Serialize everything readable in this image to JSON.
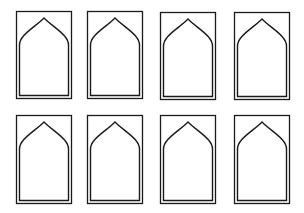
{
  "diagram": {
    "title": "",
    "stroke_color": "#1a1a1a",
    "background_color": "#ffffff",
    "rows": 2,
    "columns": 4,
    "frames": [
      {
        "row": 1,
        "col": 1,
        "x": 15,
        "y": 10,
        "w": 56,
        "h": 88
      },
      {
        "row": 1,
        "col": 2,
        "x": 86,
        "y": 10,
        "w": 56,
        "h": 88
      },
      {
        "row": 1,
        "col": 3,
        "x": 159,
        "y": 11,
        "w": 56,
        "h": 88
      },
      {
        "row": 1,
        "col": 4,
        "x": 233,
        "y": 11,
        "w": 56,
        "h": 88
      },
      {
        "row": 2,
        "col": 1,
        "x": 15,
        "y": 114,
        "w": 56,
        "h": 89
      },
      {
        "row": 2,
        "col": 2,
        "x": 86,
        "y": 114,
        "w": 56,
        "h": 89
      },
      {
        "row": 2,
        "col": 3,
        "x": 159,
        "y": 114,
        "w": 56,
        "h": 89
      },
      {
        "row": 2,
        "col": 4,
        "x": 233,
        "y": 114,
        "w": 56,
        "h": 89
      }
    ]
  }
}
